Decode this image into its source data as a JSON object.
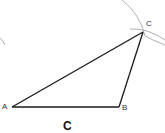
{
  "diagram": {
    "type": "triangle-construction",
    "vertices": {
      "A": {
        "label": "A",
        "x": 12,
        "y": 107
      },
      "B": {
        "label": "B",
        "x": 119,
        "y": 107
      },
      "C": {
        "label": "C",
        "x": 143,
        "y": 32
      }
    },
    "caption": "C",
    "colors": {
      "line": "#1a1a1a",
      "arc": "#9a9a9a",
      "label": "#333333"
    }
  }
}
